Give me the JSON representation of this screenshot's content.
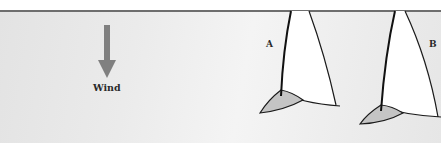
{
  "diagram": {
    "wind": {
      "label": "Wind",
      "direction": "down",
      "arrow_color": "#808080"
    },
    "boats": [
      {
        "label": "A",
        "sail_color": "#ffffff",
        "hull_color": "#c4c4c4"
      },
      {
        "label": "B",
        "sail_color": "#ffffff",
        "hull_color": "#c4c4c4"
      }
    ],
    "colors": {
      "outline": "#1a1a1a",
      "top_rule": "#6e6e6e",
      "background": "#ececec"
    }
  }
}
